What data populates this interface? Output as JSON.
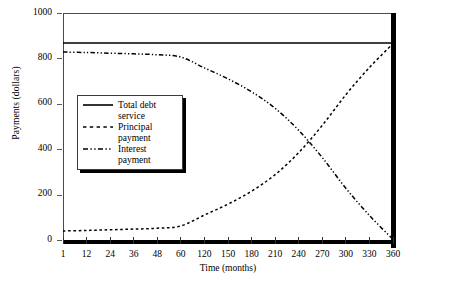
{
  "chart_data": {
    "type": "line",
    "title": "",
    "xlabel": "Time (months)",
    "ylabel": "Payments (dollars)",
    "xtick_labels": [
      "1",
      "12",
      "24",
      "36",
      "48",
      "60",
      "120",
      "150",
      "180",
      "210",
      "240",
      "270",
      "300",
      "330",
      "360"
    ],
    "ytick_labels": [
      "0",
      "200",
      "400",
      "600",
      "800",
      "1000"
    ],
    "ylim": [
      0,
      1000
    ],
    "grid": false,
    "legend_position": "inside-left",
    "x_scale": "categorical-equal-spacing",
    "x": [
      1,
      12,
      24,
      36,
      48,
      60,
      120,
      150,
      180,
      210,
      240,
      270,
      300,
      330,
      360
    ],
    "series": [
      {
        "name": "Total debt service",
        "style": "solid",
        "color": "#000000",
        "values": [
          868,
          868,
          868,
          868,
          868,
          868,
          868,
          868,
          868,
          868,
          868,
          868,
          868,
          868,
          868
        ]
      },
      {
        "name": "Principal payment",
        "style": "dotted",
        "color": "#000000",
        "values": [
          40,
          42,
          45,
          48,
          52,
          62,
          110,
          158,
          215,
          288,
          385,
          505,
          640,
          760,
          865
        ]
      },
      {
        "name": "Interest payment",
        "style": "dash-dot-dot",
        "color": "#000000",
        "values": [
          828,
          826,
          823,
          820,
          816,
          806,
          758,
          710,
          653,
          580,
          483,
          363,
          228,
          108,
          3
        ]
      }
    ]
  },
  "axes": {
    "y_label": "Payments (dollars)",
    "x_label": "Time (months)",
    "y_ticks": [
      "1000",
      "800",
      "600",
      "400",
      "200",
      "0"
    ],
    "x_ticks": [
      "1",
      "12",
      "24",
      "36",
      "48",
      "60",
      "120",
      "150",
      "180",
      "210",
      "240",
      "270",
      "300",
      "330",
      "360"
    ]
  },
  "legend": {
    "entries": [
      {
        "label": "Total debt\nservice",
        "style": "solid"
      },
      {
        "label": "Principal\npayment",
        "style": "dotted"
      },
      {
        "label": "Interest\npayment",
        "style": "dash-dot-dot"
      }
    ]
  },
  "colors": {
    "ink": "#000000",
    "frame": "#4a4a4a",
    "background": "#ffffff"
  }
}
